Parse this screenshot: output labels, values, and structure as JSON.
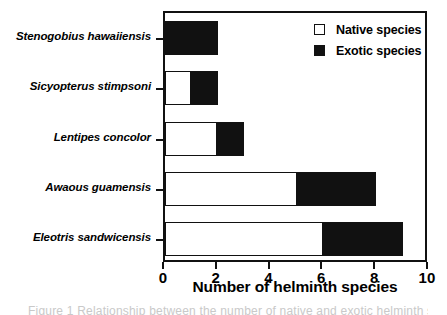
{
  "chart_data": {
    "type": "bar",
    "orientation": "horizontal",
    "stacked": true,
    "title": "",
    "xlabel": "Number of helminth species",
    "ylabel": "",
    "xlim": [
      0,
      10
    ],
    "xticks": [
      0,
      2,
      4,
      6,
      8,
      10
    ],
    "xticklabels": [
      "0",
      "2",
      "4",
      "6",
      "8",
      "10"
    ],
    "grid": false,
    "legend_position": "top-right inside plot",
    "categories": [
      "Stenogobius hawaiiensis",
      "Sicyopterus stimpsoni",
      "Lentipes concolor",
      "Awaous guamensis",
      "Eleotris sandwicensis"
    ],
    "series": [
      {
        "name": "Native species",
        "color": "#ffffff",
        "values": [
          0,
          1,
          2,
          5,
          6
        ]
      },
      {
        "name": "Exotic species",
        "color": "#111111",
        "values": [
          2,
          1,
          1,
          3,
          3
        ]
      }
    ],
    "totals": [
      2,
      2,
      3,
      8,
      9
    ]
  },
  "legend": {
    "items": [
      {
        "label": "Native species",
        "swatch": "white-square-outline"
      },
      {
        "label": "Exotic species",
        "swatch": "black-square-filled"
      }
    ]
  },
  "caption": {
    "text": "Figure 1 Relationship between the number of native and exotic helminth species"
  }
}
